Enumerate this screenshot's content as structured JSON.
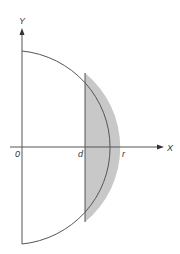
{
  "diagram": {
    "axes": {
      "x_label": "X",
      "y_label": "Y",
      "origin_label": "0"
    },
    "points": {
      "d_label": "d",
      "r_label": "r"
    },
    "colors": {
      "stroke": "#555555",
      "shaded_fill": "#c8c8c8",
      "background": "#ffffff"
    }
  }
}
